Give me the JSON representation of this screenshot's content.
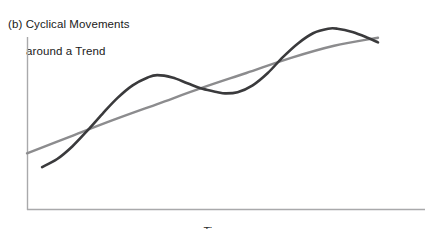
{
  "figure": {
    "caption_label": "(b)",
    "caption_line1": "(b) Cyclical Movements",
    "caption_line2": "around a Trend",
    "caption_full": "(b) Cyclical Movements around a Trend",
    "xaxis_title": "Time",
    "background_color": "#ffffff"
  },
  "axes": {
    "color": "#a9a9ab",
    "y_axis_top_y": 37,
    "y_axis_bottom_y": 210,
    "x_axis_left_x": 27,
    "x_axis_right_x": 425
  },
  "chart_data": {
    "type": "line",
    "title": "(b) Cyclical Movements around a Trend",
    "xlabel": "Time",
    "ylabel": "",
    "grid": false,
    "legend": false,
    "xlim": [
      0,
      100
    ],
    "ylim": [
      0,
      100
    ],
    "x_axis_ticks": [],
    "y_axis_ticks": [],
    "annotations": [
      "Dark curve oscillates cyclically above and below the smooth gray trend line",
      "Curves cross at roughly x=16, x=44, x=73 (normalized x units)"
    ],
    "series": [
      {
        "name": "Cyclical series",
        "color": "#3a3a3c",
        "width": 2.6,
        "points": [
          {
            "x": 4.3,
            "y": 21.9
          },
          {
            "x": 8.6,
            "y": 26.0
          },
          {
            "x": 12.9,
            "y": 32.4
          },
          {
            "x": 17.2,
            "y": 40.5
          },
          {
            "x": 21.5,
            "y": 49.1
          },
          {
            "x": 25.8,
            "y": 57.2
          },
          {
            "x": 30.1,
            "y": 63.6
          },
          {
            "x": 34.4,
            "y": 67.6
          },
          {
            "x": 37.1,
            "y": 68.8
          },
          {
            "x": 41.4,
            "y": 67.6
          },
          {
            "x": 45.7,
            "y": 64.7
          },
          {
            "x": 50.0,
            "y": 61.8
          },
          {
            "x": 54.3,
            "y": 60.1
          },
          {
            "x": 56.4,
            "y": 59.5
          },
          {
            "x": 60.0,
            "y": 60.1
          },
          {
            "x": 64.3,
            "y": 63.6
          },
          {
            "x": 68.6,
            "y": 69.9
          },
          {
            "x": 72.9,
            "y": 78.0
          },
          {
            "x": 77.2,
            "y": 85.0
          },
          {
            "x": 81.5,
            "y": 90.2
          },
          {
            "x": 85.8,
            "y": 92.5
          },
          {
            "x": 88.4,
            "y": 92.5
          },
          {
            "x": 92.7,
            "y": 90.8
          },
          {
            "x": 97.0,
            "y": 87.9
          },
          {
            "x": 100.0,
            "y": 85.5
          }
        ]
      },
      {
        "name": "Trend line",
        "color": "#8c8c8e",
        "width": 2.4,
        "points": [
          {
            "x": 0.0,
            "y": 28.9
          },
          {
            "x": 12.5,
            "y": 37.6
          },
          {
            "x": 25.0,
            "y": 46.2
          },
          {
            "x": 37.5,
            "y": 54.3
          },
          {
            "x": 50.0,
            "y": 62.4
          },
          {
            "x": 62.5,
            "y": 69.9
          },
          {
            "x": 75.0,
            "y": 77.5
          },
          {
            "x": 87.5,
            "y": 83.8
          },
          {
            "x": 100.0,
            "y": 87.9
          }
        ]
      }
    ]
  }
}
